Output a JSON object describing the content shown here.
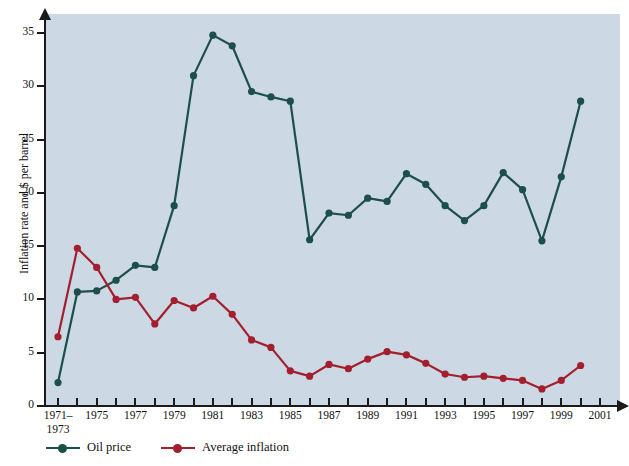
{
  "chart_data": {
    "type": "line",
    "title": "",
    "xlabel": "",
    "ylabel": "Inflation rate and $ per barrel",
    "ylim": [
      0,
      36
    ],
    "yticks": [
      0,
      5,
      10,
      15,
      20,
      25,
      30,
      35
    ],
    "grid": false,
    "legend_position": "below-left",
    "x_first_label_line1": "1971–",
    "x_first_label_line2": "1973",
    "x": [
      "1971-1973",
      "1974",
      "1975",
      "1976",
      "1977",
      "1978",
      "1979",
      "1980",
      "1981",
      "1982",
      "1983",
      "1984",
      "1985",
      "1986",
      "1987",
      "1988",
      "1989",
      "1990",
      "1991",
      "1992",
      "1993",
      "1994",
      "1995",
      "1996",
      "1997",
      "1998",
      "1999",
      "2000"
    ],
    "xtick_labels": [
      "1971–1973",
      "",
      "1975",
      "",
      "1977",
      "",
      "1979",
      "",
      "1981",
      "",
      "1983",
      "",
      "1985",
      "",
      "1987",
      "",
      "1989",
      "",
      "1991",
      "",
      "1993",
      "",
      "1995",
      "",
      "1997",
      "",
      "1999",
      "",
      "2001"
    ],
    "xtick_major": [
      "1971–1973",
      "1975",
      "1977",
      "1979",
      "1981",
      "1983",
      "1985",
      "1987",
      "1989",
      "1991",
      "1993",
      "1995",
      "1997",
      "1999",
      "2001"
    ],
    "series": [
      {
        "name": "Oil price",
        "color": "#1d4f4a",
        "values": [
          2.2,
          10.7,
          10.8,
          11.8,
          13.2,
          13.0,
          18.8,
          31.0,
          34.8,
          33.8,
          29.5,
          29.0,
          28.6,
          15.6,
          18.1,
          17.9,
          19.5,
          19.2,
          21.8,
          20.8,
          18.8,
          17.4,
          18.8,
          21.9,
          20.3,
          15.5,
          21.5,
          28.6
        ]
      },
      {
        "name": "Average inflation",
        "color": "#a31f2e",
        "values": [
          6.5,
          14.8,
          13.0,
          10.0,
          10.2,
          7.7,
          9.9,
          9.2,
          10.3,
          8.6,
          6.2,
          5.5,
          3.3,
          2.8,
          3.9,
          3.5,
          4.4,
          5.1,
          4.8,
          4.0,
          3.0,
          2.7,
          2.8,
          2.6,
          2.4,
          1.6,
          2.4,
          3.8
        ]
      }
    ]
  },
  "legend": {
    "items": [
      {
        "label": "Oil price",
        "color": "#1d4f4a"
      },
      {
        "label": "Average inflation",
        "color": "#a31f2e"
      }
    ]
  },
  "axis": {
    "y_title": "Inflation rate and $ per barrel",
    "y_tick_labels": [
      "0",
      "5",
      "10",
      "15",
      "20",
      "25",
      "30",
      "35"
    ]
  }
}
